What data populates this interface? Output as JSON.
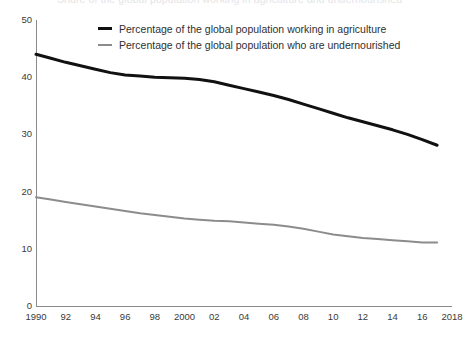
{
  "title_cropped": "Share of the global population working in agriculture and undernourished",
  "legend": {
    "position": "top-center-inside",
    "entries": [
      {
        "label": "Percentage of the global population working in agriculture",
        "color": "#111111",
        "swatch": "thick"
      },
      {
        "label": "Percentage of the global population who are undernourished",
        "color": "#8c8c8c",
        "swatch": "thin"
      }
    ]
  },
  "axes": {
    "y_ticks": [
      "50",
      "40",
      "30",
      "20",
      "10",
      "0"
    ],
    "x_ticks": [
      "1990",
      "92",
      "94",
      "96",
      "98",
      "2000",
      "02",
      "04",
      "06",
      "08",
      "10",
      "12",
      "14",
      "16",
      "2018"
    ]
  },
  "chart_data": {
    "type": "line",
    "title": "",
    "xlabel": "",
    "ylabel": "",
    "xlim": [
      1990,
      2018
    ],
    "ylim": [
      0,
      50
    ],
    "yticks": [
      0,
      10,
      20,
      30,
      40,
      50
    ],
    "xticks": [
      1990,
      1992,
      1994,
      1996,
      1998,
      2000,
      2002,
      2004,
      2006,
      2008,
      2010,
      2012,
      2014,
      2016,
      2018
    ],
    "xticklabels": [
      "1990",
      "92",
      "94",
      "96",
      "98",
      "2000",
      "02",
      "04",
      "06",
      "08",
      "10",
      "12",
      "14",
      "16",
      "2018"
    ],
    "grid": false,
    "legend_position": "upper center",
    "x": [
      1990,
      1991,
      1992,
      1993,
      1994,
      1995,
      1996,
      1997,
      1998,
      1999,
      2000,
      2001,
      2002,
      2003,
      2004,
      2005,
      2006,
      2007,
      2008,
      2009,
      2010,
      2011,
      2012,
      2013,
      2014,
      2015,
      2016,
      2017
    ],
    "series": [
      {
        "name": "Percentage of the global population working in agriculture",
        "color": "#111111",
        "width": 3,
        "values": [
          44.0,
          43.3,
          42.6,
          42.0,
          41.4,
          40.8,
          40.4,
          40.2,
          40.0,
          39.9,
          39.8,
          39.6,
          39.2,
          38.6,
          38.0,
          37.4,
          36.8,
          36.1,
          35.3,
          34.5,
          33.7,
          32.9,
          32.2,
          31.5,
          30.8,
          30.0,
          29.1,
          28.1
        ]
      },
      {
        "name": "Percentage of the global population who are undernourished",
        "color": "#8c8c8c",
        "width": 2,
        "values": [
          19.0,
          18.6,
          18.2,
          17.8,
          17.4,
          17.0,
          16.6,
          16.2,
          15.9,
          15.6,
          15.3,
          15.1,
          14.9,
          14.8,
          14.6,
          14.4,
          14.2,
          13.9,
          13.5,
          13.0,
          12.5,
          12.2,
          11.9,
          11.7,
          11.5,
          11.3,
          11.1,
          11.1
        ]
      }
    ]
  }
}
